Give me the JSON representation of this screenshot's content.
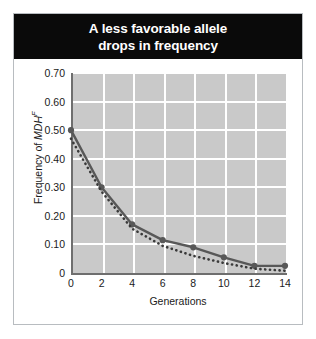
{
  "title": {
    "line1": "A less favorable allele",
    "line2": "drops in frequency"
  },
  "axes": {
    "x_title": "Generations",
    "y_title_prefix": "Frequency of ",
    "y_title_gene": "MDH",
    "y_title_superscript": "F",
    "y_ticks": [
      "0.70",
      "0.60",
      "0.50",
      "0.40",
      "0.30",
      "0.20",
      "0.10",
      "0"
    ],
    "x_ticks": [
      "0",
      "2",
      "4",
      "6",
      "8",
      "10",
      "12",
      "14"
    ]
  },
  "colors": {
    "banner": "#0a0a0a",
    "banner_text": "#ffffff",
    "plot_background": "#c9c9c9",
    "gridline": "#ffffff",
    "axis": "#6e6e6e",
    "solid_series": "#585858",
    "dotted_series": "#3a3a3a",
    "frame": "#b8bcc0"
  },
  "chart_data": {
    "type": "line",
    "title": "A less favorable allele drops in frequency",
    "xlabel": "Generations",
    "ylabel": "Frequency of MDH^F",
    "xlim": [
      0,
      14
    ],
    "ylim": [
      0,
      0.7
    ],
    "grid": true,
    "legend": "none",
    "x": [
      0,
      2,
      4,
      6,
      8,
      10,
      12,
      14
    ],
    "series": [
      {
        "name": "Observed frequency",
        "style": "solid-with-markers",
        "marker": "circle",
        "values": [
          0.5,
          0.3,
          0.17,
          0.115,
          0.09,
          0.055,
          0.025,
          0.025
        ]
      },
      {
        "name": "Predicted frequency",
        "style": "dotted",
        "marker": "none",
        "values": [
          0.47,
          0.285,
          0.155,
          0.095,
          0.06,
          0.035,
          0.015,
          0.008
        ]
      }
    ]
  }
}
